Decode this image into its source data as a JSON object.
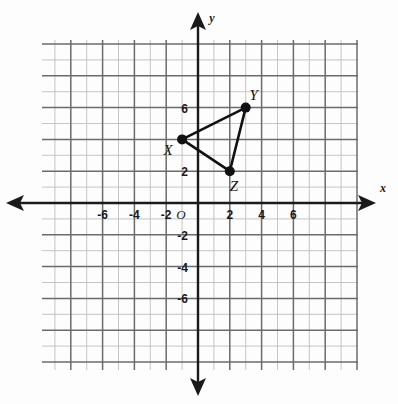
{
  "figure": {
    "background_color": "#fdfdfd",
    "ink_color": "#1a1a1a",
    "grid_color": "#6b6b6b",
    "minor_grid_color": "#b8b8b8"
  },
  "chart_data": {
    "type": "scatter",
    "title": "",
    "xlabel": "x",
    "ylabel": "y",
    "xlim": [
      -8,
      8
    ],
    "ylim": [
      -8,
      8
    ],
    "grid": true,
    "legend": "none",
    "x_tick_labels": [
      "-6",
      "-4",
      "-2",
      "2",
      "4",
      "6"
    ],
    "x_tick_values": [
      -6,
      -4,
      -2,
      2,
      4,
      6
    ],
    "y_tick_labels": [
      "6",
      "2",
      "-2",
      "-4",
      "-6"
    ],
    "y_tick_values": [
      6,
      2,
      -2,
      -4,
      -6
    ],
    "origin_label": "O",
    "series": [
      {
        "name": "Triangle XYZ",
        "closed": true,
        "points": [
          {
            "label": "X",
            "x": -1,
            "y": 4,
            "label_dx": -14,
            "label_dy": 16
          },
          {
            "label": "Y",
            "x": 3,
            "y": 6,
            "label_dx": 8,
            "label_dy": -8
          },
          {
            "label": "Z",
            "x": 2,
            "y": 2,
            "label_dx": 4,
            "label_dy": 20
          }
        ]
      }
    ],
    "annotations": [
      {
        "text": "x",
        "role": "x-axis-name"
      },
      {
        "text": "y",
        "role": "y-axis-name"
      }
    ]
  },
  "axes": {
    "x_axis_label": "x",
    "y_axis_label": "y",
    "origin": "O"
  },
  "ticks": {
    "x": [
      {
        "value": -6,
        "text": "-6"
      },
      {
        "value": -4,
        "text": "-4"
      },
      {
        "value": -2,
        "text": "-2"
      },
      {
        "value": 2,
        "text": "2"
      },
      {
        "value": 4,
        "text": "4"
      },
      {
        "value": 6,
        "text": "6"
      }
    ],
    "y": [
      {
        "value": 6,
        "text": "6"
      },
      {
        "value": 2,
        "text": "2"
      },
      {
        "value": -2,
        "text": "-2"
      },
      {
        "value": -4,
        "text": "-4"
      },
      {
        "value": -6,
        "text": "-6"
      }
    ]
  },
  "vertices": {
    "x_point": {
      "name": "X",
      "x": -1,
      "y": 4
    },
    "y_point": {
      "name": "Y",
      "x": 3,
      "y": 6
    },
    "z_point": {
      "name": "Z",
      "x": 2,
      "y": 2
    }
  }
}
